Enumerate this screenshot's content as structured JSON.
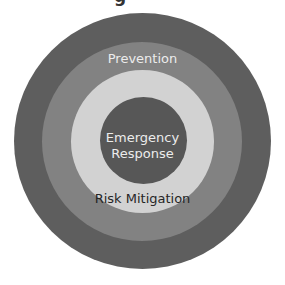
{
  "diagram": {
    "title_partial": "g",
    "type": "concentric-circles",
    "layers": [
      {
        "name": "outer",
        "label": "",
        "color": "#5e5e5e"
      },
      {
        "name": "prevention",
        "label": "Prevention",
        "color": "#828282",
        "text_color": "#ececec"
      },
      {
        "name": "risk-mitigation",
        "label": "Risk Mitigation",
        "color": "#d2d2d2",
        "text_color": "#262626"
      },
      {
        "name": "emergency-response",
        "label_line1": "Emergency",
        "label_line2": "Response",
        "color": "#575757",
        "text_color": "#ececec"
      }
    ]
  }
}
